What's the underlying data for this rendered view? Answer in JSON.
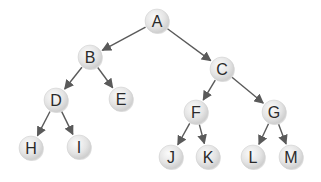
{
  "diagram": {
    "type": "binary-tree",
    "edge_color": "#5a5a5a",
    "node_fill_light": "#fbfbfb",
    "node_fill_dark": "#c9c9c9",
    "node_radius": 12,
    "nodes": [
      {
        "id": "A",
        "label": "A",
        "x": 157,
        "y": 21
      },
      {
        "id": "B",
        "label": "B",
        "x": 90,
        "y": 57
      },
      {
        "id": "C",
        "label": "C",
        "x": 222,
        "y": 69
      },
      {
        "id": "D",
        "label": "D",
        "x": 56,
        "y": 100
      },
      {
        "id": "E",
        "label": "E",
        "x": 121,
        "y": 99
      },
      {
        "id": "F",
        "label": "F",
        "x": 196,
        "y": 112
      },
      {
        "id": "G",
        "label": "G",
        "x": 274,
        "y": 112
      },
      {
        "id": "H",
        "label": "H",
        "x": 31,
        "y": 148
      },
      {
        "id": "I",
        "label": "I",
        "x": 79,
        "y": 147
      },
      {
        "id": "J",
        "label": "J",
        "x": 171,
        "y": 157
      },
      {
        "id": "K",
        "label": "K",
        "x": 208,
        "y": 157
      },
      {
        "id": "L",
        "label": "L",
        "x": 253,
        "y": 157
      },
      {
        "id": "M",
        "label": "M",
        "x": 291,
        "y": 157
      }
    ],
    "edges": [
      {
        "from": "A",
        "to": "B"
      },
      {
        "from": "A",
        "to": "C"
      },
      {
        "from": "B",
        "to": "D"
      },
      {
        "from": "B",
        "to": "E"
      },
      {
        "from": "C",
        "to": "F"
      },
      {
        "from": "C",
        "to": "G"
      },
      {
        "from": "D",
        "to": "H"
      },
      {
        "from": "D",
        "to": "I"
      },
      {
        "from": "F",
        "to": "J"
      },
      {
        "from": "F",
        "to": "K"
      },
      {
        "from": "G",
        "to": "L"
      },
      {
        "from": "G",
        "to": "M"
      }
    ]
  }
}
